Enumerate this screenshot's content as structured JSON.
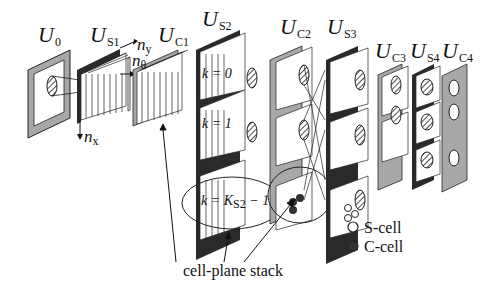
{
  "diagram": {
    "type": "neocognitron-architecture",
    "layers": [
      {
        "id": "U0",
        "main": "U",
        "sub": "0"
      },
      {
        "id": "US1",
        "main": "U",
        "sub": "S1"
      },
      {
        "id": "UC1",
        "main": "U",
        "sub": "C1"
      },
      {
        "id": "US2",
        "main": "U",
        "sub": "S2"
      },
      {
        "id": "UC2",
        "main": "U",
        "sub": "C2"
      },
      {
        "id": "US3",
        "main": "U",
        "sub": "S3"
      },
      {
        "id": "UC3",
        "main": "U",
        "sub": "C3"
      },
      {
        "id": "US4",
        "main": "U",
        "sub": "S4"
      },
      {
        "id": "UC4",
        "main": "U",
        "sub": "C4"
      }
    ],
    "axes": {
      "ny": "n",
      "ny_sub": "y",
      "ntheta": "n",
      "ntheta_sub": "θ",
      "nx": "n",
      "nx_sub": "x"
    },
    "k_labels": {
      "k0": "k = 0",
      "k1": "k = 1",
      "klast_pre": "k = K",
      "klast_sub": "S2",
      "klast_post": " − 1"
    },
    "annotation": "cell-plane stack",
    "legend": [
      {
        "label": "S-cell",
        "marker": "open-circle",
        "color": "#ffffff"
      },
      {
        "label": "C-cell",
        "marker": "filled-circle",
        "color": "#333333"
      }
    ],
    "colors": {
      "ink": "#111111",
      "gray": "#a8a8a8",
      "dark": "#2a2a2a",
      "paper": "#ffffff"
    }
  }
}
